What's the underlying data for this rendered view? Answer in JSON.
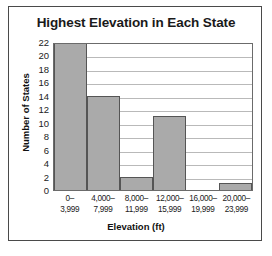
{
  "chart_data": {
    "type": "bar",
    "title": "Highest Elevation in Each State",
    "xlabel": "Elevation (ft)",
    "ylabel": "Number of States",
    "categories": [
      "0–3,999",
      "4,000–7,999",
      "8,000–11,999",
      "12,000–15,999",
      "16,000–19,999",
      "20,000–23,999"
    ],
    "category_lines": [
      [
        "0–",
        "3,999"
      ],
      [
        "4,000–",
        "7,999"
      ],
      [
        "8,000–",
        "11,999"
      ],
      [
        "12,000–",
        "15,999"
      ],
      [
        "16,000–",
        "19,999"
      ],
      [
        "20,000–",
        "23,999"
      ]
    ],
    "values": [
      22,
      14,
      2,
      11,
      0,
      1
    ],
    "ylim": [
      0,
      22
    ],
    "ytick_step": 2,
    "yticks": [
      0,
      2,
      4,
      6,
      8,
      10,
      12,
      14,
      16,
      18,
      20,
      22
    ],
    "grid": "horizontal",
    "legend": "none",
    "bar_color": "#aaaaaa",
    "bar_edge_color": "#555555",
    "gridline_color": "#b9b9b9",
    "frame_color": "#6b6b6b",
    "text_color": "#1a1a1a"
  }
}
